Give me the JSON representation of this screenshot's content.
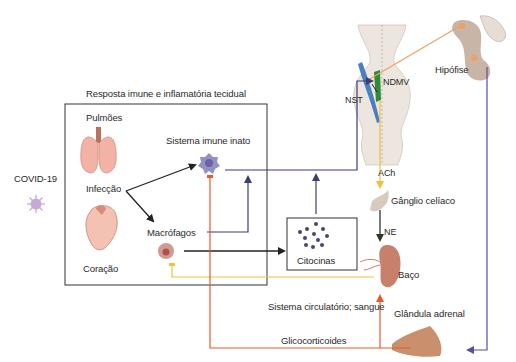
{
  "figure": {
    "type": "neuro-immune pathway diagram",
    "colors": {
      "black_arrow": "#222222",
      "navy_arrow": "#3c3d78",
      "orange_arrow": "#e8582a",
      "yellow_arrow": "#f2c037",
      "peach_line": "#f0a060",
      "purple_line": "#5b4f9a",
      "box_border": "#333333"
    }
  },
  "labels": {
    "covid": "COVID-19",
    "tissue_box_title": "Resposta imune e inflamatória tecidual",
    "lungs": "Pulmões",
    "infection": "Infecção",
    "heart": "Coração",
    "innate_immune": "Sistema imune inato",
    "macrophages": "Macrófagos",
    "cytokines": "Citocinas",
    "nst": "NST",
    "ndmv": "NDMV",
    "pituitary": "Hipófise",
    "ach": "ACh",
    "celiac_ganglion": "Gânglio celíaco",
    "ne": "NE",
    "spleen": "Baço",
    "circulatory": "Sistema circulatório; sangue",
    "adrenal": "Glândula adrenal",
    "glucocorticoids": "Glicocorticoides"
  }
}
